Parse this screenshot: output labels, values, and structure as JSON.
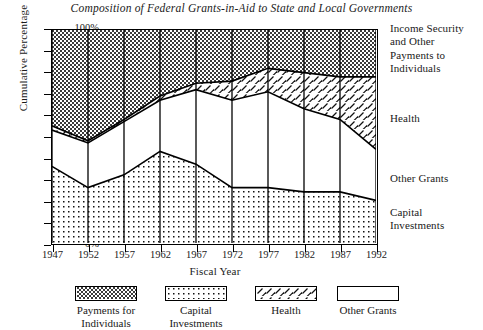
{
  "chart_data": {
    "type": "area",
    "title": "Composition of Federal Grants-in-Aid to State and Local Governments",
    "xlabel": "Fiscal Year",
    "ylabel": "Cumulative Percentage",
    "grid": false,
    "legend_position": "bottom",
    "xlim": [
      1947,
      1992
    ],
    "ylim": [
      0,
      100
    ],
    "categories": [
      1947,
      1952,
      1957,
      1962,
      1967,
      1972,
      1977,
      1982,
      1987,
      1992
    ],
    "x_tick_labels": [
      "1947",
      "1952",
      "1957",
      "1962",
      "1967",
      "1972",
      "1977",
      "1982",
      "1987",
      "1992"
    ],
    "y_tick_labels": [
      "0%",
      "10%",
      "20%",
      "30%",
      "40%",
      "50%",
      "60%",
      "70%",
      "80%",
      "90%",
      "100%"
    ],
    "y_tick_values": [
      0,
      10,
      20,
      30,
      40,
      50,
      60,
      70,
      80,
      90,
      100
    ],
    "stacked": true,
    "series": [
      {
        "name": "Capital Investments",
        "pattern": "fine-dots",
        "values": [
          36,
          26,
          32,
          43,
          37,
          26,
          26,
          24,
          24,
          20
        ]
      },
      {
        "name": "Other Grants",
        "pattern": "solid-white",
        "values": [
          17,
          21,
          25,
          24,
          35,
          41,
          45,
          39,
          34,
          24
        ]
      },
      {
        "name": "Health",
        "pattern": "diagonal-dashes",
        "values": [
          2,
          1,
          1,
          2,
          3,
          9,
          11,
          17,
          20,
          34
        ]
      },
      {
        "name": "Payments for Individuals",
        "pattern": "dense-stipple",
        "values": [
          45,
          52,
          42,
          31,
          25,
          24,
          18,
          20,
          22,
          22
        ]
      }
    ],
    "cumulative": {
      "capital_top": [
        36,
        26,
        32,
        43,
        37,
        26,
        26,
        24,
        24,
        20
      ],
      "other_grants_top": [
        53,
        47,
        57,
        67,
        72,
        67,
        71,
        63,
        58,
        44
      ],
      "health_top": [
        55,
        48,
        58,
        69,
        75,
        76,
        82,
        80,
        78,
        78
      ],
      "payments_top": [
        100,
        100,
        100,
        100,
        100,
        100,
        100,
        100,
        100,
        100
      ]
    },
    "annotations": [
      {
        "name": "income-security-callout",
        "text": "Income Security and Other Payments to Individuals",
        "lines": [
          "Income Security",
          "and Other",
          "Payments to",
          "Individuals"
        ],
        "top": 22
      },
      {
        "name": "health-callout",
        "text": "Health",
        "lines": [
          "Health"
        ],
        "top": 112
      },
      {
        "name": "other-grants-callout",
        "text": "Other Grants",
        "lines": [
          "Other Grants"
        ],
        "top": 172
      },
      {
        "name": "capital-investments-callout",
        "text": "Capital Investments",
        "lines": [
          "Capital",
          "Investments"
        ],
        "top": 206
      }
    ],
    "legend": [
      {
        "name": "Payments for Individuals",
        "lines": [
          "Payments for",
          "Individuals"
        ],
        "pattern": "dense-stipple",
        "left": 56
      },
      {
        "name": "Capital Investments",
        "lines": [
          "Capital",
          "Investments"
        ],
        "pattern": "fine-dots",
        "left": 146
      },
      {
        "name": "Health",
        "lines": [
          "Health"
        ],
        "pattern": "diagonal-dashes",
        "left": 236
      },
      {
        "name": "Other Grants",
        "lines": [
          "Other Grants"
        ],
        "pattern": "solid-white",
        "left": 318
      }
    ]
  }
}
